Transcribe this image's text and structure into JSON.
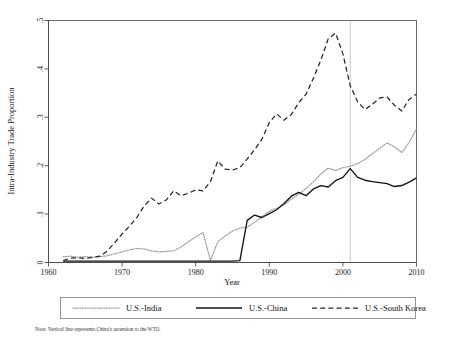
{
  "chart_data": {
    "type": "line",
    "title": "",
    "xlabel": "Year",
    "ylabel": "Intra-Industry Trade Proportion",
    "xlim": [
      1960,
      2010
    ],
    "ylim": [
      0,
      0.5
    ],
    "xticks": [
      1960,
      1970,
      1980,
      1990,
      2000,
      2010
    ],
    "xticklabels": [
      "1960",
      "1970",
      "1980",
      "1990",
      "2000",
      "2010"
    ],
    "yticks": [
      0,
      0.1,
      0.2,
      0.3,
      0.4,
      0.5
    ],
    "yticklabels": [
      "0",
      ".1",
      ".2",
      ".3",
      ".4",
      ".5"
    ],
    "grid": false,
    "legend_position": "below-plot",
    "x": [
      1962,
      1963,
      1964,
      1965,
      1966,
      1967,
      1968,
      1969,
      1970,
      1971,
      1972,
      1973,
      1974,
      1975,
      1976,
      1977,
      1978,
      1979,
      1980,
      1981,
      1982,
      1983,
      1984,
      1985,
      1986,
      1987,
      1988,
      1989,
      1990,
      1991,
      1992,
      1993,
      1994,
      1995,
      1996,
      1997,
      1998,
      1999,
      2000,
      2001,
      2002,
      2003,
      2004,
      2005,
      2006,
      2007,
      2008,
      2009,
      2010
    ],
    "series": [
      {
        "name": "U.S.-India",
        "style": "dotted",
        "color": "#9a9a9a",
        "values": [
          0.012,
          0.013,
          0.011,
          0.012,
          0.011,
          0.012,
          0.014,
          0.018,
          0.022,
          0.026,
          0.029,
          0.028,
          0.024,
          0.022,
          0.023,
          0.024,
          0.032,
          0.043,
          0.053,
          0.062,
          0.004,
          0.043,
          0.055,
          0.065,
          0.071,
          0.073,
          0.083,
          0.095,
          0.106,
          0.112,
          0.119,
          0.131,
          0.141,
          0.153,
          0.167,
          0.183,
          0.195,
          0.19,
          0.196,
          0.199,
          0.204,
          0.213,
          0.225,
          0.236,
          0.247,
          0.239,
          0.227,
          0.248,
          0.276
        ]
      },
      {
        "name": "U.S.-China",
        "style": "solid",
        "color": "#131313",
        "values": [
          0.003,
          0.003,
          0.003,
          0.003,
          0.003,
          0.003,
          0.003,
          0.003,
          0.003,
          0.003,
          0.003,
          0.003,
          0.003,
          0.003,
          0.003,
          0.003,
          0.003,
          0.003,
          0.003,
          0.003,
          0.003,
          0.003,
          0.003,
          0.003,
          0.004,
          0.087,
          0.098,
          0.093,
          0.101,
          0.109,
          0.122,
          0.137,
          0.145,
          0.138,
          0.152,
          0.159,
          0.156,
          0.169,
          0.176,
          0.194,
          0.176,
          0.17,
          0.167,
          0.165,
          0.163,
          0.157,
          0.159,
          0.166,
          0.175
        ]
      },
      {
        "name": "U.S.-South Korea",
        "style": "dashed",
        "color": "#262626",
        "values": [
          0.004,
          0.009,
          0.01,
          0.008,
          0.011,
          0.013,
          0.024,
          0.041,
          0.059,
          0.075,
          0.093,
          0.117,
          0.133,
          0.121,
          0.129,
          0.148,
          0.138,
          0.143,
          0.15,
          0.148,
          0.167,
          0.21,
          0.193,
          0.191,
          0.196,
          0.214,
          0.233,
          0.255,
          0.289,
          0.307,
          0.294,
          0.306,
          0.33,
          0.348,
          0.381,
          0.418,
          0.462,
          0.474,
          0.431,
          0.365,
          0.332,
          0.316,
          0.327,
          0.34,
          0.342,
          0.325,
          0.313,
          0.337,
          0.348
        ]
      }
    ],
    "annotations": [
      {
        "name": "wto-vertical-line",
        "type": "vline",
        "x": 2001,
        "color": "#c9c9c9"
      }
    ],
    "note": "Note: Vertical line represents China's ascension to the WTO."
  },
  "legend": {
    "items": [
      {
        "label": "U.S.-India",
        "style": "dotted"
      },
      {
        "label": "U.S.-China",
        "style": "solid"
      },
      {
        "label": "U.S.-South Korea",
        "style": "dashed"
      }
    ]
  }
}
